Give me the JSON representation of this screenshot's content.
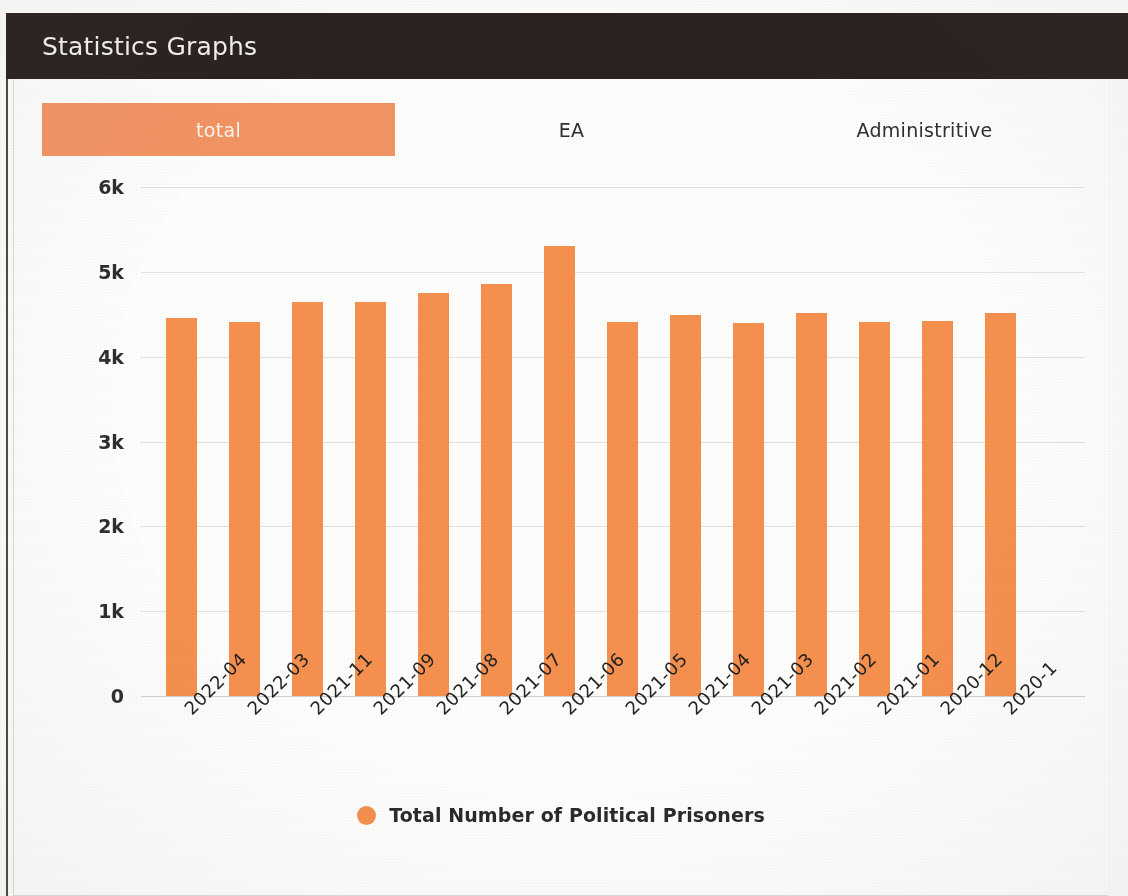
{
  "header": {
    "title": "Statistics Graphs"
  },
  "tabs": [
    {
      "label": "total",
      "active": true
    },
    {
      "label": "EA",
      "active": false
    },
    {
      "label": "Administritive",
      "active": false
    }
  ],
  "legend": {
    "label": "Total Number of Political Prisoners",
    "marker_color": "#f5904f"
  },
  "colors": {
    "bar": "#f5904f",
    "tab_active": "#f29463",
    "header_bg": "#2a2220",
    "grid": "#e2e2e2"
  },
  "chart_data": {
    "type": "bar",
    "title": "Statistics Graphs",
    "xlabel": "",
    "ylabel": "",
    "ylim": [
      0,
      6000
    ],
    "yticks": [
      0,
      1000,
      2000,
      3000,
      4000,
      5000,
      6000
    ],
    "ytick_labels": [
      "0",
      "1k",
      "2k",
      "3k",
      "4k",
      "5k",
      "6k"
    ],
    "grid": true,
    "legend_position": "bottom",
    "categories": [
      "2022-04",
      "2022-03",
      "2021-11",
      "2021-09",
      "2021-08",
      "2021-07",
      "2021-06",
      "2021-05",
      "2021-04",
      "2021-03",
      "2021-02",
      "2021-01",
      "2020-12",
      "2020-1"
    ],
    "series": [
      {
        "name": "Total Number of Political Prisoners",
        "color": "#f5904f",
        "values": [
          4460,
          4410,
          4640,
          4640,
          4750,
          4860,
          5310,
          4410,
          4490,
          4400,
          4520,
          4410,
          4420,
          4520
        ]
      }
    ]
  }
}
